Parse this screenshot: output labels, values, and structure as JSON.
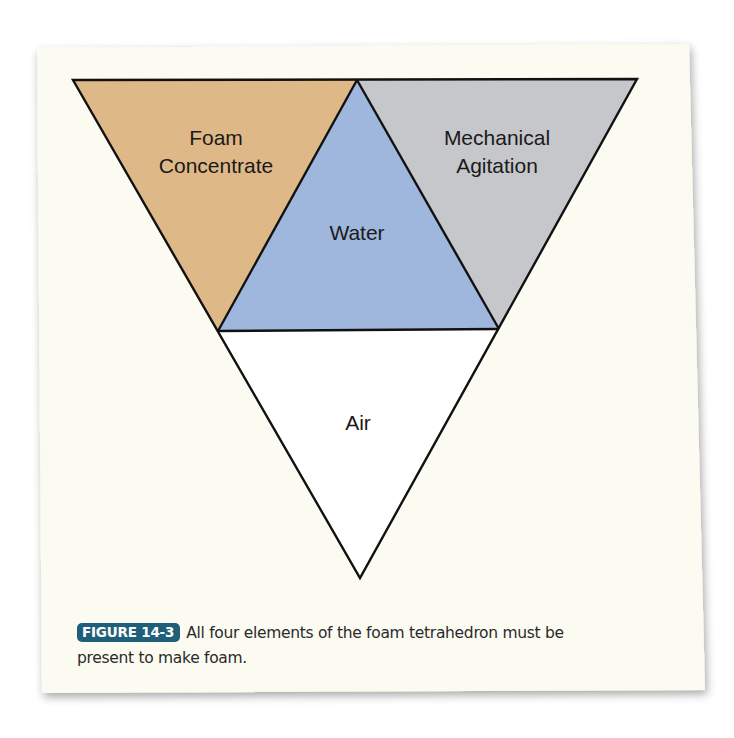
{
  "figure": {
    "badge": "FIGURE 14-3",
    "caption_line1": "All four elements of the foam tetrahedron must be",
    "caption_line2": "present to make foam."
  },
  "diagram": {
    "type": "foam-tetrahedron",
    "sections": [
      {
        "id": "foam-concentrate",
        "label_lines": [
          "Foam",
          "Concentrate"
        ],
        "color": "#dfb888"
      },
      {
        "id": "water",
        "label_lines": [
          "Water"
        ],
        "color": "#9fb6dd"
      },
      {
        "id": "mechanical-agitation",
        "label_lines": [
          "Mechanical",
          "Agitation"
        ],
        "color": "#c5c7ca"
      },
      {
        "id": "air",
        "label_lines": [
          "Air"
        ],
        "color": "#ffffff"
      }
    ],
    "outline_color": "#111111",
    "card_color": "#fcfbf2",
    "badge_color": "#1f5f7a"
  }
}
